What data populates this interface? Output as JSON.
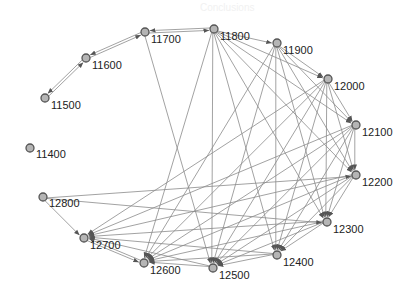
{
  "diagram": {
    "type": "directed-graph",
    "colors": {
      "edge": "#8a8a8a",
      "arrow": "#555555",
      "node_fill": "#b5b5b5",
      "node_stroke": "#555555",
      "label": "#222222"
    },
    "nodes": [
      {
        "id": "11400",
        "x": 30,
        "y": 148,
        "lx": 6,
        "ly": 10
      },
      {
        "id": "11500",
        "x": 45,
        "y": 98,
        "lx": 6,
        "ly": 11
      },
      {
        "id": "11600",
        "x": 86,
        "y": 58,
        "lx": 6,
        "ly": 11
      },
      {
        "id": "11700",
        "x": 145,
        "y": 32,
        "lx": 6,
        "ly": 11
      },
      {
        "id": "11800",
        "x": 214,
        "y": 29,
        "lx": 6,
        "ly": 11
      },
      {
        "id": "11900",
        "x": 277,
        "y": 43,
        "lx": 6,
        "ly": 11
      },
      {
        "id": "12000",
        "x": 328,
        "y": 79,
        "lx": 6,
        "ly": 11
      },
      {
        "id": "12100",
        "x": 356,
        "y": 125,
        "lx": 6,
        "ly": 11
      },
      {
        "id": "12200",
        "x": 356,
        "y": 175,
        "lx": 6,
        "ly": 11
      },
      {
        "id": "12300",
        "x": 327,
        "y": 222,
        "lx": 6,
        "ly": 11
      },
      {
        "id": "12400",
        "x": 277,
        "y": 255,
        "lx": 6,
        "ly": 11
      },
      {
        "id": "12500",
        "x": 213,
        "y": 268,
        "lx": 6,
        "ly": 11
      },
      {
        "id": "12600",
        "x": 144,
        "y": 263,
        "lx": 6,
        "ly": 11
      },
      {
        "id": "12700",
        "x": 84,
        "y": 238,
        "lx": 6,
        "ly": 11
      },
      {
        "id": "12800",
        "x": 43,
        "y": 197,
        "lx": 6,
        "ly": 10
      }
    ],
    "edges": [
      [
        "11500",
        "11600"
      ],
      [
        "11600",
        "11500"
      ],
      [
        "11600",
        "11700"
      ],
      [
        "11700",
        "11600"
      ],
      [
        "11700",
        "11800"
      ],
      [
        "11800",
        "11700"
      ],
      [
        "11800",
        "11900"
      ],
      [
        "11800",
        "12000"
      ],
      [
        "11800",
        "12100"
      ],
      [
        "11900",
        "12000"
      ],
      [
        "12000",
        "12100"
      ],
      [
        "12100",
        "12200"
      ],
      [
        "12200",
        "12300"
      ],
      [
        "12300",
        "12400"
      ],
      [
        "12400",
        "12500"
      ],
      [
        "12500",
        "12600"
      ],
      [
        "12600",
        "12700"
      ],
      [
        "12800",
        "12700"
      ],
      [
        "12700",
        "12600"
      ],
      [
        "11700",
        "12500"
      ],
      [
        "11800",
        "12200"
      ],
      [
        "11800",
        "12300"
      ],
      [
        "11800",
        "12400"
      ],
      [
        "11800",
        "12600"
      ],
      [
        "11900",
        "12200"
      ],
      [
        "11900",
        "12300"
      ],
      [
        "11900",
        "12400"
      ],
      [
        "11900",
        "12500"
      ],
      [
        "11900",
        "12600"
      ],
      [
        "12000",
        "12200"
      ],
      [
        "12000",
        "12300"
      ],
      [
        "12000",
        "12400"
      ],
      [
        "12000",
        "12500"
      ],
      [
        "12000",
        "12600"
      ],
      [
        "12000",
        "12700"
      ],
      [
        "12100",
        "12300"
      ],
      [
        "12100",
        "12400"
      ],
      [
        "12100",
        "12500"
      ],
      [
        "12100",
        "12600"
      ],
      [
        "12100",
        "12700"
      ],
      [
        "12200",
        "12400"
      ],
      [
        "12200",
        "12500"
      ],
      [
        "12200",
        "12600"
      ],
      [
        "12200",
        "12700"
      ],
      [
        "12300",
        "12500"
      ],
      [
        "12300",
        "12600"
      ],
      [
        "12300",
        "12700"
      ],
      [
        "12400",
        "12600"
      ],
      [
        "12400",
        "12700"
      ],
      [
        "12500",
        "12700"
      ],
      [
        "12800",
        "12300"
      ],
      [
        "12800",
        "12200"
      ],
      [
        "11800",
        "12500"
      ],
      [
        "11900",
        "12100"
      ]
    ]
  },
  "background_text": [
    "Conclusions",
    "In the corpus, the speech-to-text system is at",
    "work; the results can be seen in the figure, the",
    "network structure depicts the relations of"
  ]
}
